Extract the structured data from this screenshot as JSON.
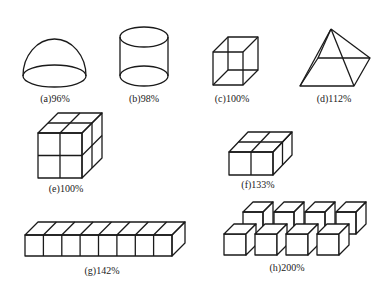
{
  "figure": {
    "panels": [
      {
        "id": "a",
        "shape": "hemisphere",
        "label": "(a)96%"
      },
      {
        "id": "b",
        "shape": "cylinder",
        "label": "(b)98%"
      },
      {
        "id": "c",
        "shape": "cube",
        "label": "(c)100%"
      },
      {
        "id": "d",
        "shape": "pyramid",
        "label": "(d)112%"
      },
      {
        "id": "e",
        "shape": "2x2x2 cube assembly",
        "label": "(e)100%"
      },
      {
        "id": "f",
        "shape": "2x2x1 slab",
        "label": "(f)133%"
      },
      {
        "id": "g",
        "shape": "1x8 bar of cubes",
        "label": "(g)142%"
      },
      {
        "id": "h",
        "shape": "staggered cubes (2 rows of 4)",
        "label": "(h)200%"
      }
    ]
  }
}
